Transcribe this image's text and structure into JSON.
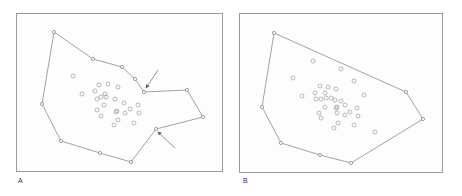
{
  "panels": [
    {
      "id": "A",
      "label": "A",
      "frame": {
        "x": 16,
        "y": 13,
        "w": 207,
        "h": 159
      },
      "label_pos": {
        "x": 18,
        "y": 180
      },
      "hull_type": "concave",
      "hull": [
        [
          54,
          32
        ],
        [
          93,
          59
        ],
        [
          122,
          67
        ],
        [
          135,
          79
        ],
        [
          144,
          92
        ],
        [
          187,
          90
        ],
        [
          203,
          117
        ],
        [
          156,
          129
        ],
        [
          131,
          162
        ],
        [
          100,
          153
        ],
        [
          61,
          141
        ],
        [
          42,
          104
        ]
      ],
      "interior_points": [
        [
          73,
          76
        ],
        [
          82,
          94
        ],
        [
          99,
          85
        ],
        [
          108,
          84
        ],
        [
          118,
          87
        ],
        [
          95,
          91
        ],
        [
          105,
          94
        ],
        [
          97,
          99
        ],
        [
          101,
          97
        ],
        [
          106,
          97
        ],
        [
          115,
          99
        ],
        [
          104,
          105
        ],
        [
          97,
          110
        ],
        [
          101,
          116
        ],
        [
          116,
          112
        ],
        [
          124,
          103
        ],
        [
          138,
          105
        ],
        [
          130,
          109
        ],
        [
          117,
          111
        ],
        [
          125,
          113
        ],
        [
          139,
          113
        ],
        [
          118,
          120
        ],
        [
          114,
          125
        ],
        [
          134,
          123
        ]
      ],
      "arrows": [
        {
          "from": [
            158,
            70
          ],
          "to": [
            146,
            88
          ]
        },
        {
          "from": [
            175,
            148
          ],
          "to": [
            158,
            132
          ]
        }
      ]
    },
    {
      "id": "B",
      "label": "B",
      "frame": {
        "x": 239,
        "y": 13,
        "w": 204,
        "h": 160
      },
      "label_pos": {
        "x": 243,
        "y": 180
      },
      "hull_type": "convex",
      "hull": [
        [
          274,
          33
        ],
        [
          406,
          92
        ],
        [
          423,
          119
        ],
        [
          351,
          163
        ],
        [
          320,
          155
        ],
        [
          281,
          143
        ],
        [
          262,
          107
        ]
      ],
      "interior_points": [
        [
          313,
          61
        ],
        [
          293,
          78
        ],
        [
          341,
          69
        ],
        [
          302,
          96
        ],
        [
          320,
          86
        ],
        [
          328,
          87
        ],
        [
          315,
          93
        ],
        [
          325,
          93
        ],
        [
          336,
          89
        ],
        [
          354,
          81
        ],
        [
          364,
          95
        ],
        [
          316,
          99
        ],
        [
          321,
          99
        ],
        [
          326,
          98
        ],
        [
          331,
          98
        ],
        [
          335,
          100
        ],
        [
          341,
          101
        ],
        [
          325,
          107
        ],
        [
          336,
          108
        ],
        [
          345,
          105
        ],
        [
          319,
          113
        ],
        [
          321,
          118
        ],
        [
          337,
          107
        ],
        [
          337,
          113
        ],
        [
          350,
          112
        ],
        [
          357,
          108
        ],
        [
          358,
          116
        ],
        [
          345,
          115
        ],
        [
          338,
          123
        ],
        [
          334,
          128
        ],
        [
          354,
          125
        ],
        [
          375,
          132
        ]
      ]
    }
  ],
  "colors": {
    "hull_line": "#8a8a8a",
    "point_stroke": "#8c8c8c",
    "vertex_stroke": "#7a7a7a",
    "arrow": "#666666",
    "frame": "#9a9a9a"
  }
}
